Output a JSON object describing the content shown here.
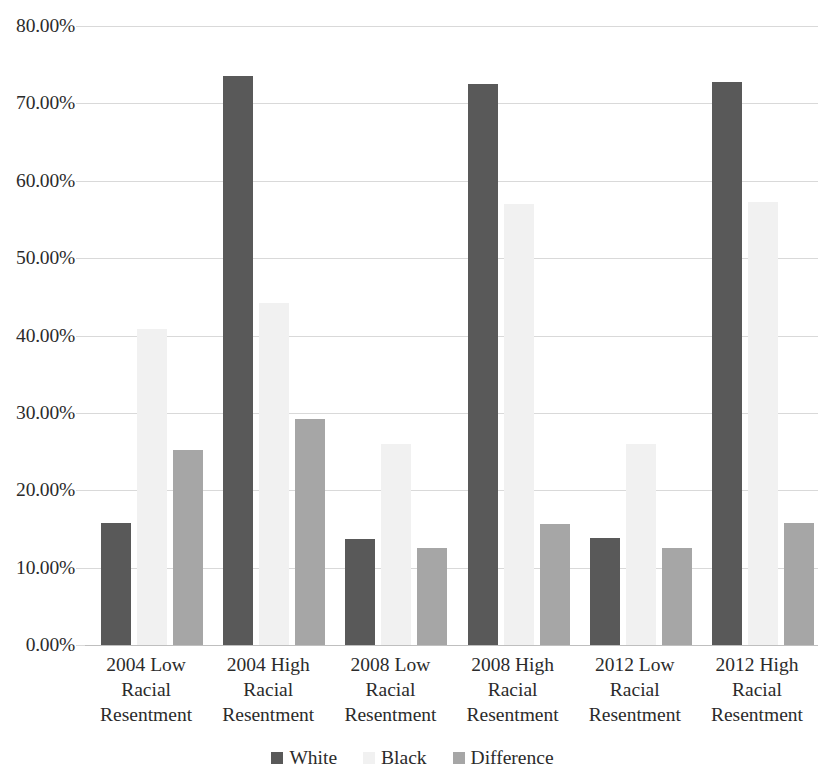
{
  "chart_data": {
    "type": "bar",
    "title": "",
    "subtitle": "",
    "xlabel": "",
    "ylabel": "",
    "ylim": [
      0,
      80
    ],
    "ytick_values": [
      0,
      10,
      20,
      30,
      40,
      50,
      60,
      70,
      80
    ],
    "ytick_labels": [
      "0.00%",
      "10.00%",
      "20.00%",
      "30.00%",
      "40.00%",
      "50.00%",
      "60.00%",
      "70.00%",
      "80.00%"
    ],
    "grid": true,
    "legend_position": "bottom",
    "categories": [
      "2004 Low Racial Resentment",
      "2004 High Racial Resentment",
      "2008 Low Racial Resentment",
      "2008 High Racial Resentment",
      "2012 Low Racial Resentment",
      "2012 High Racial Resentment"
    ],
    "category_lines": [
      [
        "2004 Low",
        "Racial",
        "Resentment"
      ],
      [
        "2004 High",
        "Racial",
        "Resentment"
      ],
      [
        "2008 Low",
        "Racial",
        "Resentment"
      ],
      [
        "2008 High",
        "Racial",
        "Resentment"
      ],
      [
        "2012 Low",
        "Racial",
        "Resentment"
      ],
      [
        "2012 High",
        "Racial",
        "Resentment"
      ]
    ],
    "series": [
      {
        "name": "White",
        "color": "#595959",
        "values": [
          15.8,
          73.5,
          13.7,
          72.5,
          13.8,
          72.7
        ]
      },
      {
        "name": "Black",
        "color": "#f1f1f1",
        "values": [
          40.8,
          44.2,
          26.0,
          57.0,
          26.0,
          57.2
        ]
      },
      {
        "name": "Difference",
        "color": "#a6a6a6",
        "values": [
          25.2,
          29.2,
          12.5,
          15.6,
          12.6,
          15.8
        ]
      }
    ]
  },
  "legend": {
    "items": [
      {
        "label": "White",
        "key": "series-white"
      },
      {
        "label": "Black",
        "key": "series-black"
      },
      {
        "label": "Difference",
        "key": "series-difference"
      }
    ]
  }
}
